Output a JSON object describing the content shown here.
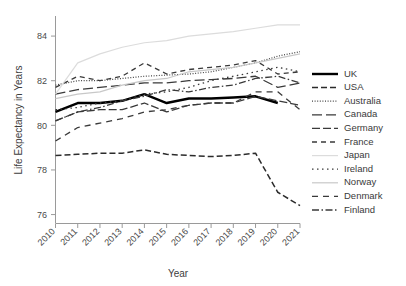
{
  "chart_data": {
    "type": "line",
    "title": "",
    "xlabel": "Year",
    "ylabel": "Life Expectancy in Years",
    "x": [
      2010,
      2011,
      2012,
      2013,
      2014,
      2015,
      2016,
      2017,
      2018,
      2019,
      2020,
      2021
    ],
    "xtick_labels": [
      "2010",
      "2011",
      "2012",
      "2013",
      "2014",
      "2015",
      "2016",
      "2017",
      "2018",
      "2019",
      "2020",
      "2021"
    ],
    "ytick_labels": [
      "76",
      "78",
      "80",
      "82",
      "84"
    ],
    "yticks": [
      76,
      78,
      80,
      82,
      84
    ],
    "xlim": [
      2010,
      2021
    ],
    "ylim": [
      75.6,
      84.9
    ],
    "grid": false,
    "legend_position": "right",
    "series": [
      {
        "name": "UK",
        "style": "solid",
        "color": "#000000",
        "width": 2.4,
        "dash": "none",
        "values": [
          80.6,
          81.0,
          81.0,
          81.1,
          81.4,
          81.0,
          81.2,
          81.2,
          81.25,
          81.3,
          81.0,
          null
        ]
      },
      {
        "name": "USA",
        "style": "dashed",
        "color": "#2b2b2b",
        "width": 1.5,
        "dash": "6,3",
        "values": [
          78.65,
          78.7,
          78.75,
          78.75,
          78.9,
          78.7,
          78.65,
          78.6,
          78.65,
          78.75,
          77.0,
          76.4
        ]
      },
      {
        "name": "Australia",
        "style": "dotted",
        "color": "#444444",
        "width": 1.2,
        "dash": "1,1.6",
        "values": [
          81.8,
          82.0,
          82.0,
          82.1,
          82.2,
          82.25,
          82.3,
          82.4,
          82.6,
          82.8,
          83.1,
          83.3
        ]
      },
      {
        "name": "Canada",
        "style": "long-dash",
        "color": "#3a3a3a",
        "width": 1.3,
        "dash": "10,4",
        "values": [
          81.4,
          81.6,
          81.7,
          81.8,
          81.9,
          81.9,
          82.0,
          82.05,
          82.1,
          82.2,
          81.7,
          81.9
        ]
      },
      {
        "name": "Germany",
        "style": "dash",
        "color": "#3a3a3a",
        "width": 1.3,
        "dash": "8,3",
        "values": [
          80.2,
          80.6,
          80.7,
          80.7,
          81.0,
          80.6,
          80.9,
          81.0,
          81.0,
          81.3,
          81.1,
          80.9
        ]
      },
      {
        "name": "France",
        "style": "short-dash",
        "color": "#3a3a3a",
        "width": 1.3,
        "dash": "5,4",
        "values": [
          81.7,
          82.2,
          82.0,
          82.2,
          82.8,
          82.3,
          82.5,
          82.6,
          82.7,
          82.9,
          82.3,
          82.4
        ]
      },
      {
        "name": "Japan",
        "style": "solid-light",
        "color": "#dcdcdc",
        "width": 1.2,
        "dash": "none",
        "values": [
          81.4,
          82.8,
          83.2,
          83.5,
          83.7,
          83.8,
          84.0,
          84.1,
          84.2,
          84.35,
          84.5,
          84.5
        ]
      },
      {
        "name": "Ireland",
        "style": "fine-dot",
        "color": "#3a3a3a",
        "width": 1.3,
        "dash": "1.5,3.5",
        "values": [
          80.7,
          80.8,
          81.0,
          81.1,
          81.4,
          81.5,
          81.7,
          82.0,
          82.2,
          82.4,
          82.6,
          82.4
        ]
      },
      {
        "name": "Norway",
        "style": "solid-pale",
        "color": "#c8c8c8",
        "width": 1.2,
        "dash": "none",
        "values": [
          81.2,
          81.4,
          81.5,
          81.8,
          82.0,
          82.1,
          82.4,
          82.5,
          82.6,
          82.8,
          83.0,
          83.2
        ]
      },
      {
        "name": "Denmark",
        "style": "medium-dash",
        "color": "#3a3a3a",
        "width": 1.3,
        "dash": "6,5",
        "values": [
          79.3,
          79.9,
          80.1,
          80.3,
          80.6,
          80.7,
          80.9,
          81.0,
          81.0,
          81.5,
          81.5,
          80.7
        ]
      },
      {
        "name": "Finland",
        "style": "dash-dot",
        "color": "#3a3a3a",
        "width": 1.3,
        "dash": "7,2.5,1.5,2.5",
        "values": [
          80.2,
          80.6,
          80.8,
          81.1,
          81.3,
          81.6,
          81.5,
          81.7,
          81.8,
          82.1,
          82.2,
          81.9
        ]
      }
    ]
  }
}
